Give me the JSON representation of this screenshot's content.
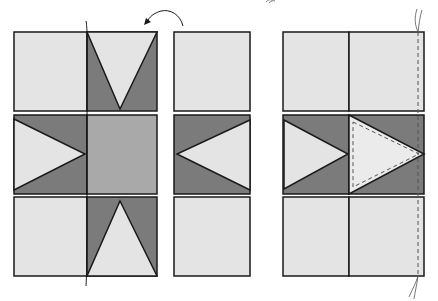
{
  "colors": {
    "light": "#e4e4e4",
    "dark": "#7b7b7b",
    "medium": "#a9a9a9",
    "stroke": "#1a1a1a",
    "dash": "#555555"
  },
  "diagram": {
    "left_block": {
      "label": ""
    },
    "middle_column": {
      "label": ""
    },
    "right_block": {
      "label": ""
    }
  }
}
